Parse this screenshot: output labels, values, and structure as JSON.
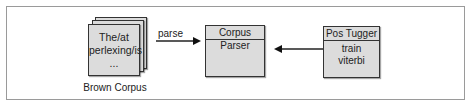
{
  "diagram": {
    "document_stack": {
      "lines": [
        "The/at",
        "perlexing/is",
        "..."
      ],
      "caption": "Brown Corpus"
    },
    "parse_arrow": {
      "label": "parse"
    },
    "corpus_parser": {
      "title": "Corpus Parser",
      "members": []
    },
    "pos_tagger": {
      "title": "Pos Tugger",
      "members": [
        "train",
        "viterbi"
      ]
    }
  }
}
